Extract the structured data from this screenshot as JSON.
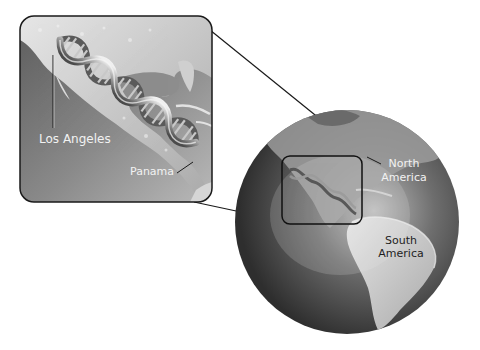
{
  "figure": {
    "type": "zoom-inset illustration"
  },
  "inset": {
    "labels": {
      "los_angeles": "Los Angeles",
      "panama": "Panama"
    }
  },
  "globe": {
    "labels": {
      "north_america_line1": "North",
      "north_america_line2": "America",
      "south_america_line1": "South",
      "south_america_line2": "America"
    }
  },
  "colors": {
    "background": "#ffffff",
    "ocean_dark": "#3a3a3a",
    "land_light": "#d8d8d8",
    "outline": "#1a1a1a",
    "label_light": "#f2f2f2",
    "label_dark": "#1e1e1e"
  }
}
